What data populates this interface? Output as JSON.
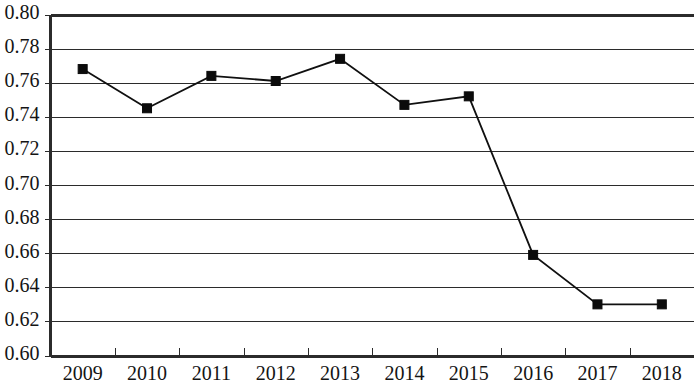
{
  "chart_data": {
    "type": "line",
    "title": "",
    "subtitle": "",
    "xlabel": "",
    "ylabel": "",
    "categories": [
      "2009",
      "2010",
      "2011",
      "2012",
      "2013",
      "2014",
      "2015",
      "2016",
      "2017",
      "2018"
    ],
    "values": [
      0.768,
      0.745,
      0.764,
      0.761,
      0.774,
      0.747,
      0.752,
      0.659,
      0.63,
      0.63
    ],
    "series": [
      {
        "name": "",
        "values": [
          0.768,
          0.745,
          0.764,
          0.761,
          0.774,
          0.747,
          0.752,
          0.659,
          0.63,
          0.63
        ]
      }
    ],
    "ylim": [
      0.6,
      0.8
    ],
    "ytick_values": [
      0.6,
      0.62,
      0.64,
      0.66,
      0.68,
      0.7,
      0.72,
      0.74,
      0.76,
      0.78,
      0.8
    ],
    "ytick_labels": [
      "0.60",
      "0.62",
      "0.64",
      "0.66",
      "0.68",
      "0.70",
      "0.72",
      "0.74",
      "0.76",
      "0.78",
      "0.80"
    ],
    "xtick_labels": [
      "2009",
      "2010",
      "2011",
      "2012",
      "2013",
      "2014",
      "2015",
      "2016",
      "2017",
      "2018"
    ],
    "grid": true,
    "grid_axis": "y",
    "legend": false,
    "legend_position": "none",
    "marker": "square",
    "marker_color": "#0b0b0b",
    "line_color": "#101010",
    "grid_color": "#2b2b2b",
    "axis_color": "#2b2b2b",
    "background_color": "#ffffff",
    "annotations": []
  }
}
